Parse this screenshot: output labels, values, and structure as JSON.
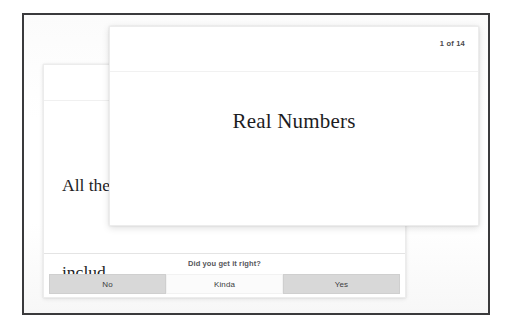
{
  "app": {
    "title": "Flashcard study view"
  },
  "question_card": {
    "counter": "1 of 14",
    "title": "Real Numbers"
  },
  "answer_card": {
    "body_lines": [
      "All the",
      "includ",
      "all fra"
    ],
    "prompt": "Did you get it right?",
    "buttons": [
      {
        "label": "No",
        "style": "filled"
      },
      {
        "label": "Kinda",
        "style": "plain"
      },
      {
        "label": "Yes",
        "style": "filled"
      }
    ]
  },
  "colors": {
    "frame_border": "#3a3a3c",
    "card_background": "#ffffff",
    "button_filled": "#d8d8d8",
    "text_primary": "#1d1d1f",
    "text_secondary": "#55565a",
    "divider": "#f0f0f0"
  }
}
